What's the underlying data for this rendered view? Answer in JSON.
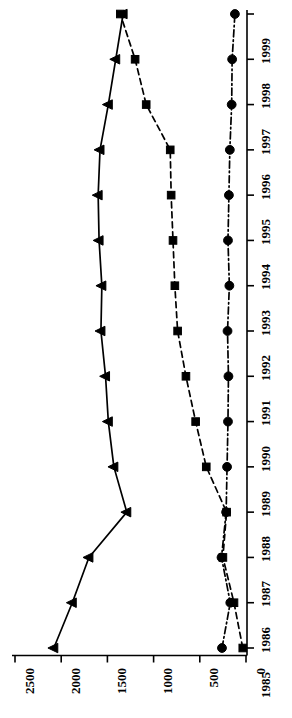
{
  "chart_data": {
    "type": "line",
    "title": "",
    "subtitle": "",
    "orientation": "rotated-90",
    "xlabel": "",
    "ylabel": "",
    "categories": [
      "1985",
      "1986",
      "1987",
      "1988",
      "1989",
      "1990",
      "1991",
      "1992",
      "1993",
      "1994",
      "1995",
      "1996",
      "1997",
      "1998",
      "1999"
    ],
    "value_ticks": [
      "2500",
      "2000",
      "1500",
      "1000",
      "500",
      "0"
    ],
    "value_tick_values": [
      2500,
      2000,
      1500,
      1000,
      500,
      0
    ],
    "vlim": [
      0,
      2500
    ],
    "grid": false,
    "legend": "none",
    "series": [
      {
        "name": "series-triangle",
        "marker": "triangle-left",
        "line_style": "solid",
        "color": "#000000",
        "values": [
          2080,
          1880,
          1700,
          1290,
          1430,
          1490,
          1520,
          1570,
          1560,
          1590,
          1600,
          1580,
          1490,
          1410,
          1330
        ]
      },
      {
        "name": "series-square",
        "marker": "square",
        "line_style": "dashed",
        "color": "#000000",
        "values": [
          35,
          130,
          250,
          210,
          430,
          545,
          650,
          740,
          770,
          790,
          810,
          820,
          1080,
          1200,
          1360
        ]
      },
      {
        "name": "series-circle",
        "marker": "circle",
        "line_style": "dash-dot",
        "color": "#000000",
        "values": [
          260,
          170,
          265,
          215,
          205,
          195,
          190,
          200,
          180,
          195,
          185,
          175,
          155,
          150,
          120
        ]
      }
    ]
  },
  "axes": {
    "value_axis_name": "value-axis",
    "category_axis_name": "year-axis"
  }
}
